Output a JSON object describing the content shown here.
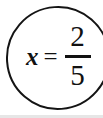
{
  "document": {
    "type": "handwritten-math-answer",
    "background_color": "#ffffff",
    "ink_color": "#111111"
  },
  "annotation": {
    "shape": "circle",
    "name": "circled-answer",
    "stroke_color": "#141414",
    "stroke_width_px": 2,
    "cropped_edge": "right"
  },
  "equation": {
    "full_text": "x = 2/5",
    "variable": "x",
    "operator": "=",
    "fraction": {
      "numerator": "2",
      "denominator": "5",
      "bar_color": "#111111"
    }
  },
  "page_edge": {
    "bottom_strip_color": "#e6e6e6"
  }
}
